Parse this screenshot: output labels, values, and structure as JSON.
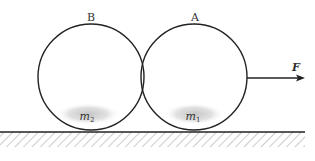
{
  "diagram": {
    "type": "physics-free-body",
    "colors": {
      "stroke": "#222222",
      "shade": "#c8c8c8",
      "hatch": "#999999",
      "background": "#ffffff"
    },
    "balls": [
      {
        "id": "B",
        "top_label": "B",
        "mass_label": "m",
        "mass_subscript": "2",
        "cx": 91,
        "cy": 77,
        "r": 53
      },
      {
        "id": "A",
        "top_label": "A",
        "mass_label": "m",
        "mass_subscript": "1",
        "cx": 194,
        "cy": 77,
        "r": 53
      }
    ],
    "force": {
      "label": "F",
      "direction": "right",
      "x_start": 247,
      "x_end": 305,
      "y": 78
    },
    "ground": {
      "y": 132,
      "x_start": 0,
      "x_end": 305,
      "hatch_depth": 15
    }
  }
}
